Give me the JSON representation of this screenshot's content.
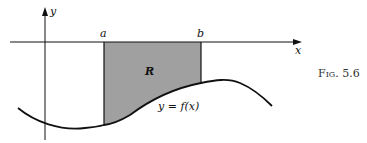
{
  "figure": {
    "caption": "Fig. 5.6",
    "axis_x_label": "x",
    "axis_y_label": "y",
    "bound_a": "a",
    "bound_b": "b",
    "region_label": "R",
    "curve_label": "y = f(x)",
    "colors": {
      "region_fill": "#a0a0a0",
      "stroke": "#111111"
    }
  }
}
